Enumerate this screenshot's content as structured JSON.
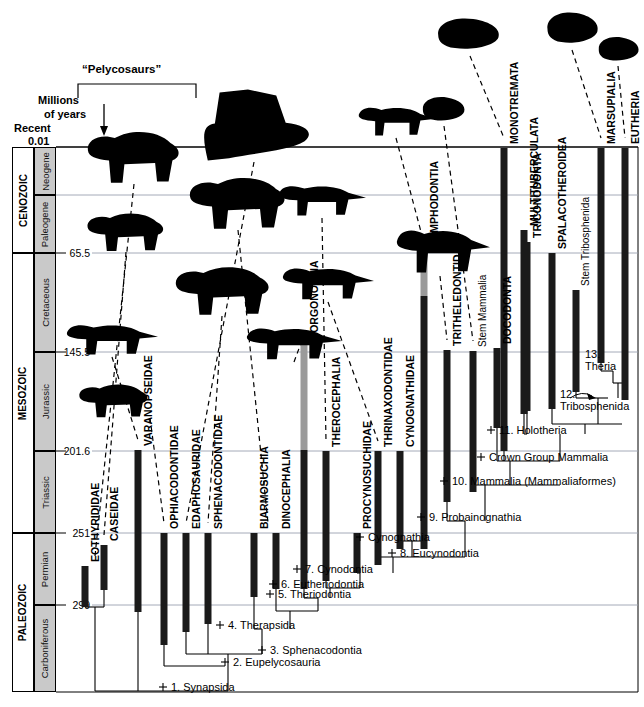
{
  "figure": {
    "axis_caption_line1": "Millions",
    "axis_caption_line2": "of years",
    "recent_label": "Recent",
    "recent_value": "0.01",
    "bracket_label": "“Pelycosaurs”",
    "colors": {
      "bar": "#1a1a1a",
      "bar_uncertain": "#9a9a9a",
      "rule": "#9aa0b0",
      "period_fill": "#c9c9c9",
      "background": "#ffffff"
    }
  },
  "time_scale": {
    "ticks": [
      {
        "value": "0.01",
        "y": 147
      },
      {
        "value": "65.5",
        "y": 253
      },
      {
        "value": "145.5",
        "y": 352
      },
      {
        "value": "201.6",
        "y": 451
      },
      {
        "value": "251",
        "y": 533
      },
      {
        "value": "299",
        "y": 605
      }
    ],
    "eras": [
      {
        "name": "CENOZOIC",
        "y": 147,
        "height": 106
      },
      {
        "name": "MESOZOIC",
        "y": 253,
        "height": 280
      },
      {
        "name": "PALEOZOIC",
        "y": 533,
        "height": 159
      }
    ],
    "periods": [
      {
        "name": "Neogene",
        "y": 147,
        "height": 48
      },
      {
        "name": "Paleogene",
        "y": 195,
        "height": 58
      },
      {
        "name": "Cretaceous",
        "y": 253,
        "height": 99
      },
      {
        "name": "Jurassic",
        "y": 352,
        "height": 99
      },
      {
        "name": "Triassic",
        "y": 451,
        "height": 82
      },
      {
        "name": "Permian",
        "y": 533,
        "height": 72
      },
      {
        "name": "Carboniferous",
        "y": 605,
        "height": 87
      }
    ]
  },
  "taxa": [
    {
      "name": "EOTHYRIDIDAE",
      "x": 85,
      "top": 566,
      "bottom": 607,
      "label_y": 562
    },
    {
      "name": "CASEIDAE",
      "x": 104,
      "top": 545,
      "bottom": 590,
      "label_y": 541
    },
    {
      "name": "VARANOPSEIDAE",
      "x": 138,
      "top": 450,
      "bottom": 612,
      "label_y": 446
    },
    {
      "name": "OPHIACODONTIDAE",
      "x": 164,
      "top": 533,
      "bottom": 645,
      "label_y": 529
    },
    {
      "name": "EDAPHOSAURIDAE",
      "x": 186,
      "top": 533,
      "bottom": 632,
      "label_y": 529
    },
    {
      "name": "SPHENACODONTIDAE",
      "x": 208,
      "top": 533,
      "bottom": 624,
      "label_y": 529
    },
    {
      "name": "BIARMOSUCHIA",
      "x": 254,
      "top": 533,
      "bottom": 597,
      "label_y": 529
    },
    {
      "name": "DINOCEPHALIA",
      "x": 276,
      "top": 533,
      "bottom": 589,
      "label_y": 529
    },
    {
      "name": "GORGONOPSIA",
      "x": 304,
      "top": 345,
      "bottom": 589,
      "label_y": 341,
      "uncertain_top": 345,
      "uncertain_bottom": 450
    },
    {
      "name": "THEROCEPHALIA",
      "x": 326,
      "top": 451,
      "bottom": 581,
      "label_y": 447
    },
    {
      "name": "PROCYNOSUCHIDAE",
      "x": 357,
      "top": 533,
      "bottom": 573,
      "label_y": 529
    },
    {
      "name": "THRINAXODONTIDAE",
      "x": 378,
      "top": 451,
      "bottom": 565,
      "label_y": 447
    },
    {
      "name": "CYNOGNATHIDAE",
      "x": 400,
      "top": 451,
      "bottom": 549,
      "label_y": 447
    },
    {
      "name": "GOMPHODONTIA",
      "x": 424,
      "top": 253,
      "bottom": 549,
      "label_y": 249,
      "uncertain_top": 253,
      "uncertain_bottom": 296
    },
    {
      "name": "TRITHELEDONTIDAE",
      "x": 447,
      "top": 350,
      "bottom": 502,
      "label_y": 346
    },
    {
      "name": "Stem Mammalia",
      "x": 473,
      "top": 351,
      "bottom": 492,
      "label_y": 347,
      "mixedcase": true
    },
    {
      "name": "DOCODONTA",
      "x": 497,
      "top": 348,
      "bottom": 428,
      "label_y": 344
    },
    {
      "name": "TRICONODONTA",
      "x": 527,
      "top": 242,
      "bottom": 411,
      "label_y": 238
    },
    {
      "name": "MONOTREMATA",
      "x": 504,
      "top": 148,
      "bottom": 451,
      "label_y": 144
    },
    {
      "name": "MULTITUBERCULATA",
      "x": 524,
      "top": 230,
      "bottom": 414,
      "label_y": 226
    },
    {
      "name": "SPALACOTHEROIDEA",
      "x": 552,
      "top": 253,
      "bottom": 409,
      "label_y": 249
    },
    {
      "name": "Stem Tribosphenida",
      "x": 576,
      "top": 290,
      "bottom": 392,
      "label_y": 286,
      "mixedcase": true
    },
    {
      "name": "MARSUPIALIA",
      "x": 601,
      "top": 148,
      "bottom": 363,
      "label_y": 144
    },
    {
      "name": "EUTHERIA",
      "x": 625,
      "top": 148,
      "bottom": 400,
      "label_y": 144
    }
  ],
  "nodes": [
    {
      "label": "1. Synapsida",
      "x": 171,
      "y": 691
    },
    {
      "label": "2. Eupelycosauria",
      "x": 233,
      "y": 666
    },
    {
      "label": "3. Sphenacodontia",
      "x": 270,
      "y": 654
    },
    {
      "label": "4. Therapsida",
      "x": 228,
      "y": 629
    },
    {
      "label": "5. Theriodontia",
      "x": 278,
      "y": 598
    },
    {
      "label": "6. Eutheriodontia",
      "x": 281,
      "y": 588
    },
    {
      "label": "7. Cynodontia",
      "x": 305,
      "y": 573
    },
    {
      "label": "8. Eucynodontia",
      "x": 400,
      "y": 557
    },
    {
      "label": "Cynognathia",
      "x": 368,
      "y": 541
    },
    {
      "label": "9. Probainognathia",
      "x": 429,
      "y": 521
    },
    {
      "label": "10. Mammalia (Mammaliaformes)",
      "x": 452,
      "y": 485
    },
    {
      "label": "Crown Group Mammalia",
      "x": 489,
      "y": 461
    },
    {
      "label": "11. Holotheria",
      "x": 499,
      "y": 434
    },
    {
      "label": "12.",
      "x": 560,
      "y": 398
    },
    {
      "label": "Tribosphenida",
      "x": 560,
      "y": 410
    },
    {
      "label": "13.",
      "x": 585,
      "y": 358
    },
    {
      "label": "Theria",
      "x": 585,
      "y": 370
    }
  ],
  "silhouettes": [
    {
      "name": "ophiacodont",
      "x": 86,
      "y": 122,
      "w": 96,
      "h": 62
    },
    {
      "name": "caseid",
      "x": 86,
      "y": 206,
      "w": 80,
      "h": 46
    },
    {
      "name": "varanopseid",
      "x": 66,
      "y": 315,
      "w": 92,
      "h": 42
    },
    {
      "name": "eothyridid",
      "x": 78,
      "y": 378,
      "w": 72,
      "h": 40
    },
    {
      "name": "edaphosaurid-sail",
      "x": 196,
      "y": 88,
      "w": 118,
      "h": 74
    },
    {
      "name": "dinocephalian",
      "x": 174,
      "y": 258,
      "w": 98,
      "h": 58
    },
    {
      "name": "anomodont",
      "x": 188,
      "y": 168,
      "w": 100,
      "h": 62
    },
    {
      "name": "gorgonopsian",
      "x": 246,
      "y": 318,
      "w": 96,
      "h": 44
    },
    {
      "name": "therocephalian",
      "x": 278,
      "y": 176,
      "w": 88,
      "h": 42
    },
    {
      "name": "cynodont",
      "x": 282,
      "y": 258,
      "w": 92,
      "h": 44
    },
    {
      "name": "tritylodont",
      "x": 358,
      "y": 98,
      "w": 78,
      "h": 40
    },
    {
      "name": "trithelodont",
      "x": 396,
      "y": 216,
      "w": 94,
      "h": 60
    },
    {
      "name": "docodont",
      "x": 420,
      "y": 92,
      "w": 48,
      "h": 34
    },
    {
      "name": "monotreme",
      "x": 434,
      "y": 12,
      "w": 70,
      "h": 44
    },
    {
      "name": "multituberculate",
      "x": 544,
      "y": 6,
      "w": 58,
      "h": 44
    },
    {
      "name": "eutherian-shrew",
      "x": 596,
      "y": 32,
      "w": 46,
      "h": 34
    }
  ]
}
